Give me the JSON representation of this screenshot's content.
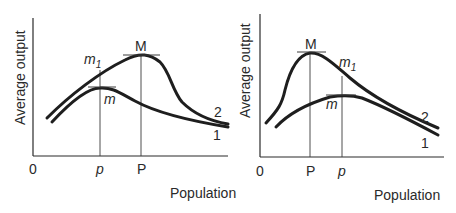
{
  "panels": [
    {
      "id": "left",
      "y_axis_label": "Average output",
      "x_axis_label": "Population",
      "origin_label": "0",
      "x_ticks": [
        {
          "label": "p",
          "italic": true
        },
        {
          "label": "P",
          "italic": false
        }
      ],
      "point_labels": {
        "M": "M",
        "m1_base": "m",
        "m1_sub": "1",
        "m": "m"
      },
      "curve_labels": {
        "curve2": "2",
        "curve1": "1"
      }
    },
    {
      "id": "right",
      "y_axis_label": "Average output",
      "x_axis_label": "Population",
      "origin_label": "0",
      "x_ticks": [
        {
          "label": "P",
          "italic": false
        },
        {
          "label": "p",
          "italic": true
        }
      ],
      "point_labels": {
        "M": "M",
        "m1_base": "m",
        "m1_sub": "1",
        "m": "m"
      },
      "curve_labels": {
        "curve2": "2",
        "curve1": "1"
      }
    }
  ],
  "colors": {
    "ink": "#1e1e1e",
    "background": "#ffffff"
  }
}
